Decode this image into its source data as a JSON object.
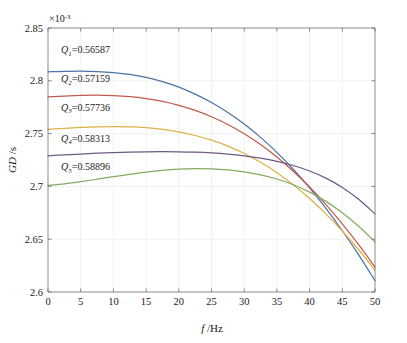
{
  "chart_data": {
    "type": "line",
    "title": "",
    "xlabel": "f /Hz",
    "ylabel": "GD /s",
    "xlabel_sym": "f",
    "xlabel_unit": "/Hz",
    "ylabel_sym": "GD",
    "ylabel_unit": "/s",
    "y_exponent_text": "×10",
    "y_exponent_sup": "-3",
    "y_scale": 0.001,
    "xlim": [
      0,
      50
    ],
    "ylim": [
      2.6,
      2.85
    ],
    "xticks": [
      0,
      5,
      10,
      15,
      20,
      25,
      30,
      35,
      40,
      45,
      50
    ],
    "xtick_labels": [
      "0",
      "5",
      "10",
      "15",
      "20",
      "25",
      "30",
      "35",
      "40",
      "45",
      "50"
    ],
    "yticks": [
      2.6,
      2.65,
      2.7,
      2.75,
      2.8,
      2.85
    ],
    "ytick_labels": [
      "2.6",
      "2.65",
      "2.7",
      "2.75",
      "2.8",
      "2.85"
    ],
    "grid": true,
    "legend_position": "inline-annotations",
    "x": [
      0,
      2.5,
      5,
      7.5,
      10,
      12.5,
      15,
      17.5,
      20,
      22.5,
      25,
      27.5,
      30,
      32.5,
      35,
      37.5,
      40,
      42.5,
      45,
      47.5,
      50
    ],
    "series": [
      {
        "name": "Q1=0.56587",
        "label_sym": "Q",
        "label_sub": "1",
        "label_value": "=0.56587",
        "color": "#4a74a8",
        "annotation_xy": [
          2.0,
          2.826
        ],
        "values": [
          2.8085,
          2.809,
          2.8092,
          2.8088,
          2.8078,
          2.806,
          2.8032,
          2.7992,
          2.794,
          2.7874,
          2.7794,
          2.77,
          2.759,
          2.7464,
          2.7322,
          2.7162,
          2.6986,
          2.6792,
          2.658,
          2.6352,
          2.6108
        ]
      },
      {
        "name": "Q2=0.57159",
        "label_sym": "Q",
        "label_sub": "2",
        "label_value": "=0.57159",
        "color": "#bf5b4b",
        "annotation_xy": [
          2.0,
          2.7985
        ],
        "values": [
          2.7848,
          2.7856,
          2.7862,
          2.7864,
          2.786,
          2.785,
          2.7832,
          2.7805,
          2.7768,
          2.772,
          2.766,
          2.7586,
          2.7498,
          2.7396,
          2.7278,
          2.7144,
          2.6994,
          2.6828,
          2.6646,
          2.6448,
          2.6236
        ]
      },
      {
        "name": "Q3=0.57736",
        "label_sym": "Q",
        "label_sub": "3",
        "label_value": "=0.57736",
        "color": "#ddb247",
        "annotation_xy": [
          2.0,
          2.7715
        ],
        "values": [
          2.754,
          2.755,
          2.7558,
          2.7564,
          2.7566,
          2.7564,
          2.7556,
          2.754,
          2.7516,
          2.7482,
          2.7438,
          2.7382,
          2.7312,
          2.7228,
          2.713,
          2.7016,
          2.6886,
          2.674,
          2.6578,
          2.64,
          2.6208
        ]
      },
      {
        "name": "Q4=0.58313",
        "label_sym": "Q",
        "label_sub": "4",
        "label_value": "=0.58313",
        "color": "#6d5a84"
      },
      {
        "name": "Q5=0.58896",
        "label_sym": "Q",
        "label_sub": "5",
        "label_value": "=0.58896",
        "color": "#84ab62",
        "annotation_xy": [
          2.0,
          2.7155
        ],
        "values": [
          2.701,
          2.7025,
          2.7045,
          2.7068,
          2.7092,
          2.7115,
          2.7136,
          2.7152,
          2.7163,
          2.7168,
          2.7166,
          2.7156,
          2.7138,
          2.711,
          2.707,
          2.7016,
          2.6946,
          2.6858,
          2.675,
          2.6622,
          2.6474
        ]
      }
    ]
  }
}
